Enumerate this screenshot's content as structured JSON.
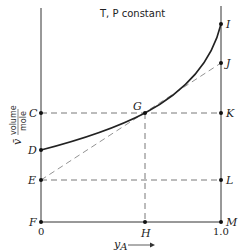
{
  "title": "T, P constant",
  "axes": {
    "x_label": "y",
    "x_label_subscript": "A",
    "x_ticks": [
      "0",
      "1.0"
    ],
    "y_label_symbol": "v̄",
    "y_label_fraction_num": "volume",
    "y_label_fraction_den": "mole"
  },
  "points": {
    "C": "C",
    "D": "D",
    "E": "E",
    "F": "F",
    "G": "G",
    "H": "H",
    "I": "I",
    "J": "J",
    "K": "K",
    "L": "L",
    "M": "M"
  }
}
